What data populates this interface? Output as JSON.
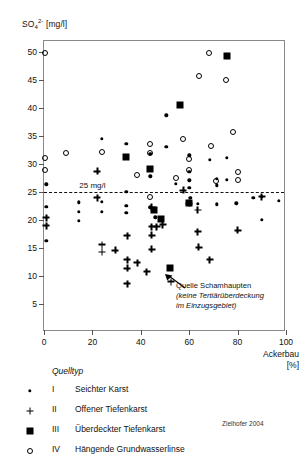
{
  "chart_data": {
    "type": "scatter",
    "title": "",
    "ylabel": "SO4 2- [mg/l]",
    "ylabel_base": "SO",
    "ylabel_sub": "4",
    "ylabel_sup": "2-",
    "ylabel_unit": "[mg/l]",
    "xlabel": "Ackerbau",
    "xlabel_unit": "[%]",
    "xlim": [
      0,
      100
    ],
    "ylim": [
      0,
      52
    ],
    "xticks": [
      0,
      20,
      40,
      60,
      80,
      100
    ],
    "yticks": [
      5,
      10,
      15,
      20,
      25,
      30,
      35,
      40,
      45,
      50
    ],
    "grid": false,
    "legend_position": "below-plot",
    "threshold": {
      "value": 25,
      "label": "25 mg/l",
      "style": "dashed",
      "label_x": 20
    },
    "annotation": {
      "line1": "Quelle Schamhaupten",
      "line2": "(keine Tertiärüberdeckung",
      "line3": "im Einzugsgebiet)",
      "points_to": [
        52,
        11.5
      ]
    },
    "credit": "Zielhofer 2004",
    "series": [
      {
        "name": "I  Seichter Karst",
        "roman": "I",
        "label": "Seichter Karst",
        "marker": "dot",
        "color": "#000000",
        "points": [
          [
            1.0,
            26.4
          ],
          [
            1.0,
            22.4
          ],
          [
            1.0,
            16.3
          ],
          [
            14.5,
            23.2
          ],
          [
            14.5,
            21.5
          ],
          [
            14.5,
            19.9
          ],
          [
            24.0,
            34.5
          ],
          [
            24.0,
            23.3
          ],
          [
            24.0,
            21.5
          ],
          [
            34.0,
            33.6
          ],
          [
            34.0,
            25.0
          ],
          [
            34.0,
            22.6
          ],
          [
            34.0,
            21.3
          ],
          [
            44.0,
            31.8
          ],
          [
            44.0,
            27.8
          ],
          [
            44.0,
            22.3
          ],
          [
            46.0,
            20.5
          ],
          [
            50.5,
            38.7
          ],
          [
            50.5,
            33.1
          ],
          [
            54.5,
            26.5
          ],
          [
            60.0,
            31.6
          ],
          [
            60.0,
            28.6
          ],
          [
            60.0,
            27.1
          ],
          [
            60.0,
            25.8
          ],
          [
            60.5,
            24.0
          ],
          [
            63.5,
            22.9
          ],
          [
            68.5,
            30.8
          ],
          [
            71.5,
            27.4
          ],
          [
            71.5,
            26.2
          ],
          [
            71.5,
            22.8
          ],
          [
            75.5,
            31.1
          ],
          [
            75.5,
            27.2
          ],
          [
            79.5,
            23.0
          ],
          [
            86.5,
            24.0
          ],
          [
            90.0,
            24.2
          ],
          [
            90.0,
            20.0
          ],
          [
            97.0,
            23.4
          ]
        ]
      },
      {
        "name": "II  Offener Tiefenkarst",
        "roman": "II",
        "label": "Offener Tiefenkarst",
        "marker": "plus",
        "color": "#000000",
        "points": [
          [
            1.0,
            20.4
          ],
          [
            1.0,
            19.0
          ],
          [
            22.0,
            28.7
          ],
          [
            22.0,
            24.0
          ],
          [
            24.0,
            15.6
          ],
          [
            24.0,
            14.3
          ],
          [
            29.5,
            14.6
          ],
          [
            34.5,
            17.2
          ],
          [
            34.5,
            12.9
          ],
          [
            34.5,
            11.4
          ],
          [
            34.5,
            8.6
          ],
          [
            38.5,
            12.4
          ],
          [
            42.5,
            10.8
          ],
          [
            44.5,
            22.3
          ],
          [
            44.5,
            18.8
          ],
          [
            44.5,
            17.3
          ],
          [
            44.5,
            14.8
          ],
          [
            46.5,
            18.8
          ],
          [
            49.0,
            19.2
          ],
          [
            52.5,
            9.0
          ],
          [
            57.5,
            25.3
          ],
          [
            60.0,
            23.0
          ],
          [
            63.5,
            21.8
          ],
          [
            63.5,
            17.9
          ],
          [
            64.0,
            15.1
          ],
          [
            68.5,
            12.9
          ],
          [
            80.0,
            18.2
          ],
          [
            90.0,
            24.2
          ]
        ]
      },
      {
        "name": "III  Überdeckter Tiefenkarst",
        "roman": "III",
        "label": "Überdeckter Tiefenkarst",
        "marker": "square",
        "color": "#000000",
        "points": [
          [
            34.0,
            31.3
          ],
          [
            44.0,
            29.2
          ],
          [
            45.5,
            21.8
          ],
          [
            48.5,
            20.2
          ],
          [
            52.0,
            11.5
          ],
          [
            56.0,
            40.6
          ],
          [
            60.0,
            23.0
          ],
          [
            75.5,
            49.3
          ]
        ]
      },
      {
        "name": "IV  Hängende Grundwasserlinse",
        "roman": "IV",
        "label": "Hängende Grundwasserlinse",
        "marker": "circle",
        "color": "#000000",
        "points": [
          [
            0.5,
            49.8
          ],
          [
            0.5,
            31.1
          ],
          [
            0.5,
            28.9
          ],
          [
            9.0,
            32.0
          ],
          [
            24.0,
            32.1
          ],
          [
            38.5,
            28.0
          ],
          [
            44.0,
            33.6
          ],
          [
            44.0,
            31.9
          ],
          [
            44.0,
            24.2
          ],
          [
            54.5,
            27.6
          ],
          [
            57.5,
            34.5
          ],
          [
            60.0,
            30.9
          ],
          [
            60.0,
            29.0
          ],
          [
            64.0,
            45.8
          ],
          [
            68.0,
            49.8
          ],
          [
            69.0,
            33.3
          ],
          [
            71.0,
            26.9
          ],
          [
            75.0,
            45.0
          ],
          [
            78.0,
            35.8
          ],
          [
            80.0,
            28.6
          ],
          [
            80.0,
            27.1
          ]
        ]
      }
    ]
  },
  "legend": {
    "title": "Quelltyp",
    "rows": [
      {
        "roman": "I",
        "label": "Seichter Karst",
        "marker": "dot"
      },
      {
        "roman": "II",
        "label": "Offener Tiefenkarst",
        "marker": "plus"
      },
      {
        "roman": "III",
        "label": "Überdeckter Tiefenkarst",
        "marker": "square"
      },
      {
        "roman": "IV",
        "label": "Hängende Grundwasserlinse",
        "marker": "circle"
      }
    ]
  }
}
